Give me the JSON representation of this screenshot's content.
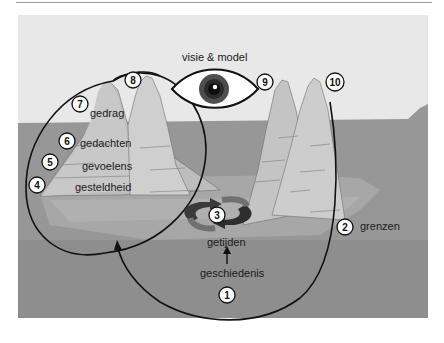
{
  "title": "visie & model",
  "labels": {
    "gedrag": "gedrag",
    "gedachten": "gedachten",
    "gevoelens": "gevoelens",
    "gesteldheid": "gesteldheid",
    "getijden": "getijden",
    "geschiedenis": "geschiedenis",
    "grenzen": "grenzen"
  },
  "markers": [
    "1",
    "2",
    "3",
    "4",
    "5",
    "6",
    "7",
    "8",
    "9",
    "10"
  ],
  "icons": {
    "eye": "eye-icon",
    "cycle": "cycle-arrows-icon",
    "arrow_up": "arrow-up-icon"
  },
  "colors": {
    "sky": "#eaeaea",
    "sea": "#9a9a9a",
    "sea_deep": "#8c8c8c",
    "ice": "#c9c9c9",
    "ice_light": "#d6d6d6",
    "outline": "#111111",
    "iris": "#5a5a5a",
    "cycle_dark": "#2f2f2f",
    "cycle_mid": "#6e6e6e"
  }
}
